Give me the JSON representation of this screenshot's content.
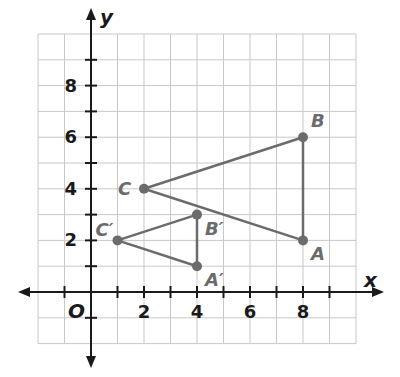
{
  "diagram": {
    "type": "coordinate-plane",
    "axes": {
      "x_label": "x",
      "y_label": "y",
      "origin_label": "O",
      "x_ticks": [
        "2",
        "4",
        "6",
        "8"
      ],
      "y_ticks": [
        "2",
        "4",
        "6",
        "8"
      ],
      "grid_range": {
        "xmin": -2,
        "xmax": 10,
        "ymin": -2,
        "ymax": 10
      }
    },
    "colors": {
      "grid": "#c8c8c8",
      "axis": "#1a1a1a",
      "figure": "#6b6b6b"
    },
    "triangles": [
      {
        "name": "ABC",
        "vertices": [
          {
            "label": "A",
            "x": 8,
            "y": 2
          },
          {
            "label": "B",
            "x": 8,
            "y": 6
          },
          {
            "label": "C",
            "x": 2,
            "y": 4
          }
        ]
      },
      {
        "name": "A'B'C'",
        "vertices": [
          {
            "label": "A′",
            "x": 4,
            "y": 1
          },
          {
            "label": "B′",
            "x": 4,
            "y": 3
          },
          {
            "label": "C′",
            "x": 1,
            "y": 2
          }
        ]
      }
    ]
  }
}
